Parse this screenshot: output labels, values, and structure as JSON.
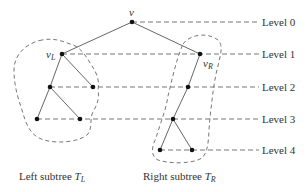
{
  "diagram": {
    "type": "binary-tree-levels",
    "nodes": [
      {
        "id": "v",
        "label": "v",
        "x": 132,
        "y": 22
      },
      {
        "id": "vL",
        "label": "v_L",
        "x": 62,
        "y": 54
      },
      {
        "id": "vR",
        "label": "v_R",
        "x": 200,
        "y": 54
      },
      {
        "id": "L2a",
        "x": 50,
        "y": 87
      },
      {
        "id": "L2b",
        "x": 93,
        "y": 87
      },
      {
        "id": "L3a",
        "x": 37,
        "y": 119
      },
      {
        "id": "L3b",
        "x": 80,
        "y": 119
      },
      {
        "id": "R2",
        "x": 188,
        "y": 87
      },
      {
        "id": "R3",
        "x": 173,
        "y": 119
      },
      {
        "id": "R4a",
        "x": 160,
        "y": 150
      },
      {
        "id": "R4b",
        "x": 192,
        "y": 150
      }
    ],
    "edges": [
      [
        "v",
        "vL"
      ],
      [
        "v",
        "vR"
      ],
      [
        "vL",
        "L2a"
      ],
      [
        "vL",
        "L2b"
      ],
      [
        "L2a",
        "L3a"
      ],
      [
        "L2a",
        "L3b"
      ],
      [
        "vR",
        "R2"
      ],
      [
        "R2",
        "R3"
      ],
      [
        "R3",
        "R4a"
      ],
      [
        "R3",
        "R4b"
      ]
    ],
    "levels": [
      {
        "label": "Level 0",
        "y": 22,
        "from_x": 132
      },
      {
        "label": "Level 1",
        "y": 54,
        "from_x": 62
      },
      {
        "label": "Level 2",
        "y": 87,
        "from_x": 50
      },
      {
        "label": "Level 3",
        "y": 119,
        "from_x": 37
      },
      {
        "label": "Level 4",
        "y": 150,
        "from_x": 160
      }
    ],
    "labels": {
      "root": "v",
      "left_child": "v",
      "left_child_sub": "L",
      "right_child": "v",
      "right_child_sub": "R",
      "left_subtree_text": "Left subtree ",
      "left_subtree_var": "T",
      "left_subtree_sub": "L",
      "right_subtree_text": "Right subtree ",
      "right_subtree_var": "T",
      "right_subtree_sub": "R"
    },
    "colors": {
      "edge": "#666666",
      "node": "#111111",
      "dash": "#777777",
      "text": "#333333"
    }
  }
}
